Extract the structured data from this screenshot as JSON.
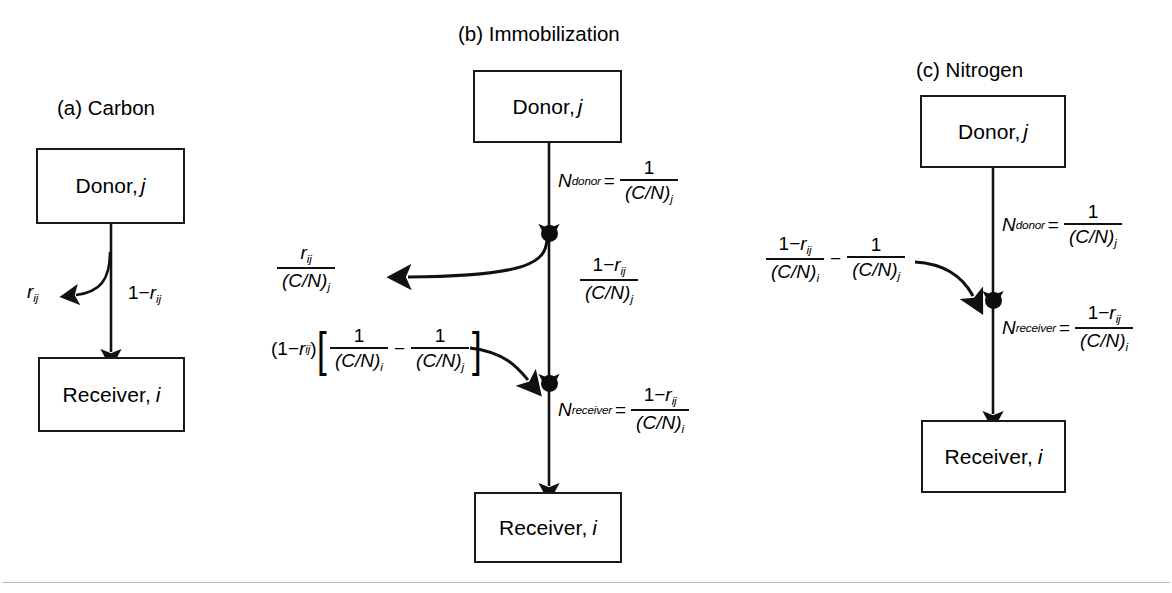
{
  "figure": {
    "panels": [
      {
        "id": "a",
        "title": "(a) Carbon",
        "donor_label": "Donor,",
        "donor_index": "j",
        "receiver_label": "Receiver,",
        "receiver_index": "i",
        "labels": {
          "branch": "r_ij",
          "branch_main": "r",
          "branch_sub": "ij",
          "main_flow_lead": "1−",
          "main_flow_var": "r",
          "main_flow_sub": "ij"
        }
      },
      {
        "id": "b",
        "title": "(b) Immobilization",
        "donor_label": "Donor,",
        "donor_index": "j",
        "receiver_label": "Receiver,",
        "receiver_index": "i",
        "labels": {
          "n_donor_name": "N",
          "n_donor_sub": "donor",
          "equals": "=",
          "n_donor_num": "1",
          "n_donor_den": "(C/N)",
          "n_donor_den_sub": "j",
          "branch_num_var": "r",
          "branch_num_sub": "ij",
          "branch_den": "(C/N)",
          "branch_den_sub": "j",
          "trunk_num_lead": "1−",
          "trunk_num_var": "r",
          "trunk_num_sub": "ij",
          "trunk_den": "(C/N)",
          "trunk_den_sub": "j",
          "bracket_prefix_open": "(1−",
          "bracket_prefix_var": "r",
          "bracket_prefix_sub": "ij",
          "bracket_prefix_close": ")",
          "bracket_open": "[",
          "bracket_close": "]",
          "bracket_term1_num": "1",
          "bracket_term1_den": "(C/N)",
          "bracket_term1_den_sub": "i",
          "bracket_minus": "−",
          "bracket_term2_num": "1",
          "bracket_term2_den": "(C/N)",
          "bracket_term2_den_sub": "j",
          "n_receiver_name": "N",
          "n_receiver_sub": "receiver",
          "n_receiver_num_lead": "1−",
          "n_receiver_num_var": "r",
          "n_receiver_num_sub": "ij",
          "n_receiver_den": "(C/N)",
          "n_receiver_den_sub": "i"
        }
      },
      {
        "id": "c",
        "title": "(c) Nitrogen",
        "donor_label": "Donor,",
        "donor_index": "j",
        "receiver_label": "Receiver,",
        "receiver_index": "i",
        "labels": {
          "n_donor_name": "N",
          "n_donor_sub": "donor",
          "equals": "=",
          "n_donor_num": "1",
          "n_donor_den": "(C/N)",
          "n_donor_den_sub": "j",
          "in_term1_num_lead": "1−",
          "in_term1_num_var": "r",
          "in_term1_num_sub": "ij",
          "in_term1_den": "(C/N)",
          "in_term1_den_sub": "i",
          "in_minus": "−",
          "in_term2_num": "1",
          "in_term2_den": "(C/N)",
          "in_term2_den_sub": "j",
          "n_receiver_name": "N",
          "n_receiver_sub": "receiver",
          "n_receiver_num_lead": "1−",
          "n_receiver_num_var": "r",
          "n_receiver_num_sub": "ij",
          "n_receiver_den": "(C/N)",
          "n_receiver_den_sub": "i"
        }
      }
    ],
    "colors": {
      "stroke": "#1a1a1a",
      "node": "#0d0d0d",
      "rule": "#b9b9b9",
      "background": "#ffffff"
    }
  }
}
